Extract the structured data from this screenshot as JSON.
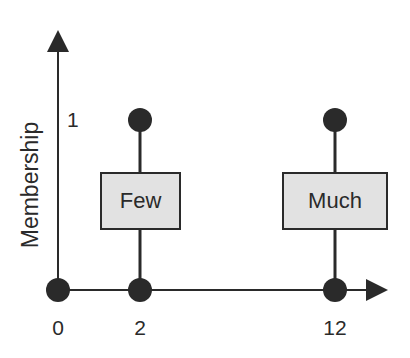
{
  "diagram": {
    "y_axis_label": "Membership",
    "y_tick": "1",
    "x_ticks": [
      "0",
      "2",
      "12"
    ],
    "boxes": [
      {
        "label": "Few"
      },
      {
        "label": "Much"
      }
    ],
    "colors": {
      "line": "#2a2a2a",
      "box_fill": "#e2e2e2",
      "point": "#2a2a2a"
    }
  }
}
